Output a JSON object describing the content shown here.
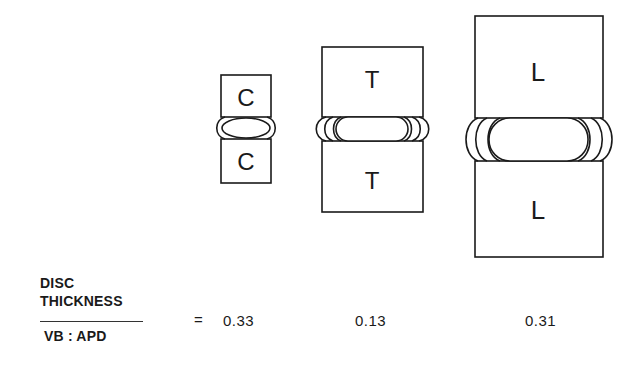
{
  "diagram": {
    "vertebrae": [
      {
        "id": "cervical",
        "upper_label": "C",
        "lower_label": "C",
        "ratio": "0.33"
      },
      {
        "id": "thoracic",
        "upper_label": "T",
        "lower_label": "T",
        "ratio": "0.13"
      },
      {
        "id": "lumbar",
        "upper_label": "L",
        "lower_label": "L",
        "ratio": "0.31"
      }
    ],
    "formula": {
      "numerator_line1": "DISC",
      "numerator_line2": "THICKNESS",
      "denominator": "VB : APD",
      "equals": "="
    },
    "colors": {
      "stroke": "#1a1a1a",
      "background": "#ffffff"
    }
  }
}
